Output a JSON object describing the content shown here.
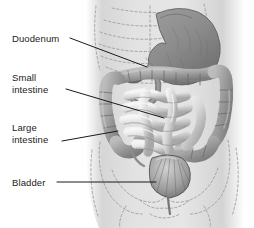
{
  "figure": {
    "background_color": "#ffffff",
    "leader_line_color": "#1a1a1a",
    "torso_fill": "#d9d9d9",
    "organ_dark": "#8a8a8a",
    "organ_mid": "#a8a8a8",
    "organ_light": "#e6e6e6",
    "dashed_bone_color": "#9a9a9a"
  },
  "labels": [
    {
      "id": "duodenum",
      "text": "Duodenum",
      "leader": {
        "x1": 70,
        "y1": 38,
        "x2": 147,
        "y2": 67
      }
    },
    {
      "id": "small-intestine",
      "text": "Small\nintestine",
      "leader": {
        "x1": 66,
        "y1": 89,
        "x2": 164,
        "y2": 118
      }
    },
    {
      "id": "large-intestine",
      "text": "Large\nintestine",
      "leader": {
        "x1": 62,
        "y1": 141,
        "x2": 118,
        "y2": 131
      }
    },
    {
      "id": "bladder",
      "text": "Bladder",
      "leader": {
        "x1": 57,
        "y1": 182,
        "x2": 156,
        "y2": 182
      }
    }
  ],
  "organs": [
    {
      "name": "stomach",
      "region": "upper-right"
    },
    {
      "name": "duodenum",
      "region": "upper-center"
    },
    {
      "name": "transverse-colon",
      "region": "mid-upper"
    },
    {
      "name": "ascending-colon",
      "region": "left"
    },
    {
      "name": "descending-colon",
      "region": "right"
    },
    {
      "name": "cecum",
      "region": "lower-left"
    },
    {
      "name": "sigmoid-colon",
      "region": "lower-right"
    },
    {
      "name": "small-intestine",
      "region": "center"
    },
    {
      "name": "bladder",
      "region": "lower-center"
    }
  ]
}
